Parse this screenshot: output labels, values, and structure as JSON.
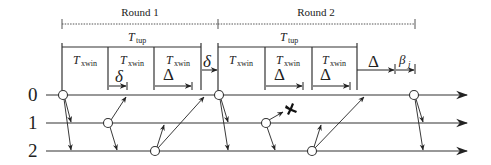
{
  "diagram": {
    "rounds": [
      {
        "label": "Round 1",
        "x1": 62,
        "x2": 218
      },
      {
        "label": "Round 2",
        "x1": 218,
        "x2": 415
      }
    ],
    "ttup_label": "T",
    "ttup_sub": "tup",
    "txwin_label": "T",
    "txwin_sub": "xwin",
    "delta_small": "δ",
    "delta_big": "Δ",
    "beta_label": "β",
    "beta_sub": "j",
    "nodes": [
      {
        "label": "0"
      },
      {
        "label": "1"
      },
      {
        "label": "2"
      }
    ],
    "failure_marker": "✖",
    "colors": {
      "line": "#333333",
      "background": "#ffffff"
    }
  }
}
